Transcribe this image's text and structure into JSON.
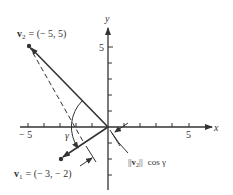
{
  "figure": {
    "axes": {
      "x_label": "x",
      "y_label": "y",
      "x_ticks": [
        -5,
        -4,
        -3,
        -2,
        -1,
        1,
        2,
        3,
        4,
        5
      ],
      "y_ticks": [
        -3,
        -2,
        -1,
        1,
        2,
        3,
        4,
        5
      ],
      "x_tick_labels": {
        "neg": "− 5",
        "pos": "5"
      },
      "y_tick_label": "5"
    },
    "vectors": {
      "v2": {
        "name": "v",
        "sub": "2",
        "value": "= (− 5,  5)",
        "x": -5,
        "y": 5
      },
      "v1": {
        "name": "v",
        "sub": "1",
        "value": "= (− 3,  − 2)",
        "x": -3,
        "y": -2
      }
    },
    "angle_label": "γ",
    "projection_label": {
      "prefix": "||",
      "name": "v",
      "sub": "2",
      "suffix": "||",
      "tail": "cos  γ"
    },
    "colors": {
      "ink": "#333333",
      "background": "#ffffff"
    }
  }
}
